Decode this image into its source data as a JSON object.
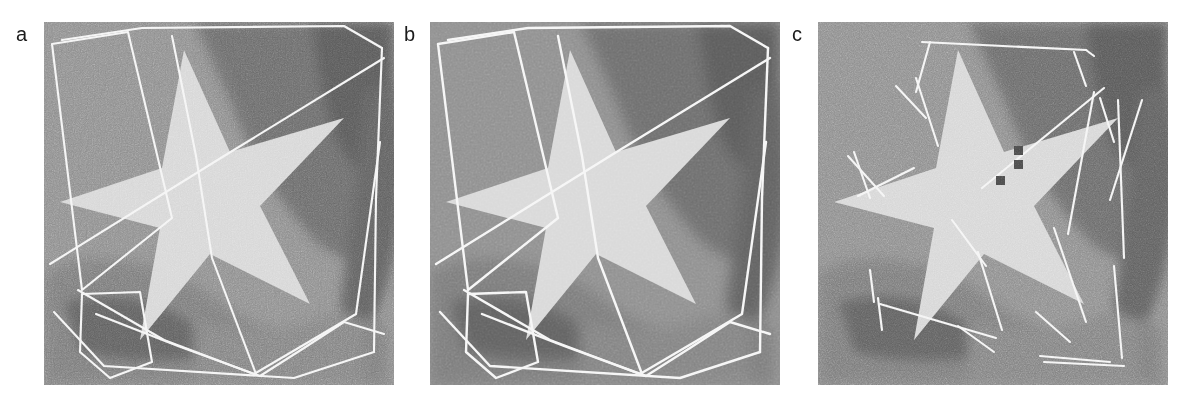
{
  "figure": {
    "type": "image-panel-row",
    "background_color": "#ffffff",
    "panel_count": 3
  },
  "palette": {
    "star_fill": "#d6d6d6",
    "background_mid": "#8d8d8d",
    "background_dark": "#6f6f6f",
    "background_darkest": "#5a5a5a",
    "line_color": "#f2f2f2",
    "marker_color": "#4a4a4a",
    "label_color": "#1b1b1b",
    "page_background": "#ffffff"
  },
  "panels": [
    {
      "id": "panel-a",
      "label": "a",
      "x": 44,
      "y": 22,
      "width": 350,
      "height": 363,
      "noise_level": "high",
      "overlay_type": "closed-polylines",
      "marker_count": 0,
      "overlays": [
        {
          "name": "outer-quad",
          "points": "18,18 98,6 300,4 338,26 330,330 250,356 60,344 10,290"
        },
        {
          "name": "left-tilted-quad",
          "points": "8,22 84,10 128,196 38,268 8,22"
        },
        {
          "name": "diagonal-long-1",
          "points": "128,14 168,236 212,352"
        },
        {
          "name": "diagonal-long-2",
          "points": "6,242 340,36"
        },
        {
          "name": "diagonal-long-3",
          "points": "34,268 210,352 312,292 336,120"
        },
        {
          "name": "bottom-left-pentagon",
          "points": "38,272 96,270 108,340 66,356 36,330 38,272"
        },
        {
          "name": "bottom-sweep",
          "points": "52,292 216,354 300,300 340,312"
        },
        {
          "name": "right-edge",
          "points": "330,28 318,208 300,300"
        }
      ]
    },
    {
      "id": "panel-b",
      "label": "b",
      "x": 430,
      "y": 22,
      "width": 350,
      "height": 363,
      "noise_level": "low",
      "overlay_type": "closed-polylines",
      "marker_count": 0,
      "overlays": [
        {
          "name": "outer-quad",
          "points": "18,18 98,6 300,4 338,26 330,330 250,356 60,344 10,290"
        },
        {
          "name": "left-tilted-quad",
          "points": "8,22 84,10 128,196 38,268 8,22"
        },
        {
          "name": "diagonal-long-1",
          "points": "128,14 168,236 212,352"
        },
        {
          "name": "diagonal-long-2",
          "points": "6,242 340,36"
        },
        {
          "name": "diagonal-long-3",
          "points": "34,268 210,352 312,292 336,120"
        },
        {
          "name": "bottom-left-pentagon",
          "points": "38,272 96,270 108,340 66,356 36,330 38,272"
        },
        {
          "name": "bottom-sweep",
          "points": "52,292 216,354 300,300 340,312"
        },
        {
          "name": "right-edge",
          "points": "330,28 318,208 300,300"
        }
      ]
    },
    {
      "id": "panel-c",
      "label": "c",
      "x": 818,
      "y": 22,
      "width": 350,
      "height": 363,
      "noise_level": "high",
      "overlay_type": "broken-segments",
      "marker_count": 3,
      "segments": [
        "104,20 268,28",
        "268,28 276,34",
        "112,20 98,70",
        "78,64 108,96",
        "120,124 98,56",
        "256,30 268,64",
        "286,66 164,166",
        "30,134 66,174",
        "36,130 52,176",
        "96,146 40,174",
        "276,70 250,212",
        "282,76 296,120",
        "300,78 306,236",
        "324,78 292,178",
        "134,198 168,244",
        "160,230 184,308",
        "236,206 268,300",
        "52,248 56,280",
        "60,276 64,308",
        "62,282 178,316",
        "140,304 176,330",
        "218,290 252,320",
        "296,244 304,336",
        "222,334 292,340",
        "226,340 306,344"
      ],
      "markers": [
        {
          "x": 196,
          "y": 124,
          "size": 9
        },
        {
          "x": 196,
          "y": 138,
          "size": 9
        },
        {
          "x": 178,
          "y": 154,
          "size": 9
        }
      ]
    }
  ],
  "star_geometry": {
    "description": "Five-pointed star, rotated slightly counter-clockwise, bright against a mid-gray textured background with darker shaded lobes.",
    "points": "140,28 186,130 300,96 216,184 266,282 166,232 96,318 116,206 16,180 118,146"
  },
  "labels": {
    "a": "a",
    "b": "b",
    "c": "c"
  }
}
